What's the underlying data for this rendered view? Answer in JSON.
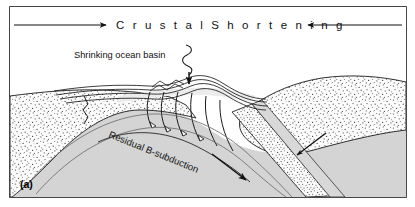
{
  "figure": {
    "panel_label": "(a)",
    "title": "C r u s t a l   S h o r t e n i n g",
    "title_plain": "Crustal Shortening",
    "annotations": {
      "ocean_basin": "Shrinking ocean basin",
      "subduction": "Residual B-subduction"
    },
    "colors": {
      "frame_border": "#1a1a1a",
      "background": "#ffffff",
      "stipple_fill": "#fbfbfb",
      "stipple_dot": "#4a4a4a",
      "mantle_fill": "#dcdcdc",
      "deep_fill": "#d2d2d2",
      "basin_fill": "#e8e8e8",
      "line_stroke": "#111111",
      "arrow_fill": "#111111"
    },
    "elements": {
      "left_arrow_name": "crustal-shortening-arrow-left",
      "right_arrow_name": "crustal-shortening-arrow-right",
      "basin_pointer_name": "ocean-basin-pointer",
      "subduction_arrow_name": "subduction-direction-arrow",
      "mantle_arrow_name": "mantle-flow-arrow"
    }
  }
}
